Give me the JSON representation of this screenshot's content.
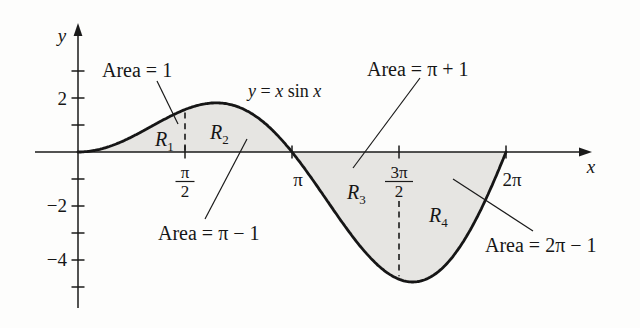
{
  "chart_data": {
    "type": "line",
    "function": "y = x·sin(x)",
    "curve_label": "y = x sin x",
    "curve_label_parts": {
      "y": "y",
      "eq": " = ",
      "x1": "x",
      "sin": " sin ",
      "x2": "x"
    },
    "x_domain": [
      0,
      6.28319
    ],
    "x_axis_label": "x",
    "y_axis_label": "y",
    "x_ticks": [
      {
        "style": "fraction",
        "num": "π",
        "den": "2",
        "value": 1.5708
      },
      {
        "style": "plain",
        "label": "π",
        "value": 3.14159
      },
      {
        "style": "fraction",
        "num": "3π",
        "den": "2",
        "value": 4.71239
      },
      {
        "style": "plain",
        "label": "2π",
        "value": 6.28319
      }
    ],
    "y_ticks": [
      {
        "value": 3,
        "label": ""
      },
      {
        "value": 2,
        "label": "2"
      },
      {
        "value": 1,
        "label": ""
      },
      {
        "value": -1,
        "label": ""
      },
      {
        "value": -2,
        "label": "−2"
      },
      {
        "value": -3,
        "label": ""
      },
      {
        "value": -4,
        "label": "−4"
      },
      {
        "value": -5,
        "label": ""
      }
    ],
    "regions": [
      {
        "name": "R",
        "sub": "1",
        "x_from": 0,
        "x_to": 1.5708,
        "area_text": "Area = 1"
      },
      {
        "name": "R",
        "sub": "2",
        "x_from": 1.5708,
        "x_to": 3.14159,
        "area_text": "Area = π − 1"
      },
      {
        "name": "R",
        "sub": "3",
        "x_from": 3.14159,
        "x_to": 4.71239,
        "area_text": "Area = π + 1"
      },
      {
        "name": "R",
        "sub": "4",
        "x_from": 4.71239,
        "x_to": 6.28319,
        "area_text": "Area = 2π − 1"
      }
    ],
    "dashed_lines_at": [
      1.5708,
      4.71239
    ],
    "shade_color": "#e6e5e2",
    "ink_color": "#1a1a1a"
  }
}
